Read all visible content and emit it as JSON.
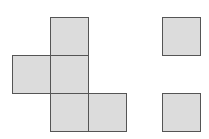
{
  "diagram": {
    "colors": {
      "fill": "#dcdcdc",
      "stroke": "#555555",
      "background": "#ffffff"
    },
    "squares": [
      {
        "id": "a-top",
        "group": "figure",
        "x": 50,
        "y": 17
      },
      {
        "id": "a-left",
        "group": "figure",
        "x": 12,
        "y": 55
      },
      {
        "id": "a-center",
        "group": "figure",
        "x": 50,
        "y": 55
      },
      {
        "id": "a-bottom",
        "group": "figure",
        "x": 50,
        "y": 93
      },
      {
        "id": "a-bottom-right",
        "group": "figure",
        "x": 88,
        "y": 93
      },
      {
        "id": "b-top",
        "group": "loose",
        "x": 162,
        "y": 17
      },
      {
        "id": "b-bottom",
        "group": "loose",
        "x": 162,
        "y": 93
      }
    ],
    "square_size": 39
  }
}
